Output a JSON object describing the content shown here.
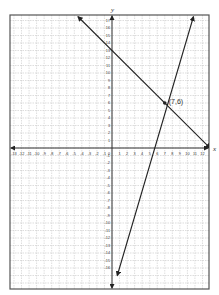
{
  "chart_data": {
    "type": "line",
    "title": "",
    "xlabel": "x",
    "ylabel": "y",
    "xlim": [
      -13,
      13
    ],
    "ylim": [
      -17,
      17
    ],
    "grid": true,
    "x_ticks": [
      -13,
      -12,
      -11,
      -10,
      -9,
      -8,
      -7,
      -6,
      -5,
      -4,
      -3,
      -2,
      -1,
      1,
      2,
      3,
      4,
      5,
      6,
      7,
      8,
      9,
      10,
      11,
      12
    ],
    "y_ticks": [
      -16,
      -15,
      -14,
      -13,
      -12,
      -11,
      -10,
      -9,
      -8,
      -7,
      -6,
      -5,
      -4,
      -3,
      -2,
      -1,
      1,
      2,
      3,
      4,
      5,
      6,
      7,
      8,
      9,
      10,
      11,
      12,
      13,
      14,
      15,
      16,
      17
    ],
    "origin_label": "0",
    "series": [
      {
        "name": "line1",
        "equation": "y = -x + 13",
        "points": [
          [
            -4.5,
            17.5
          ],
          [
            13,
            0
          ]
        ],
        "arrows": "both"
      },
      {
        "name": "line2",
        "equation": "y = 3x - 15",
        "points": [
          [
            0.7,
            -17
          ],
          [
            10.8,
            17.5
          ]
        ],
        "arrows": "both"
      }
    ],
    "annotations": [
      {
        "text": "(7,6)",
        "x": 7,
        "y": 6,
        "marker": "dot"
      }
    ]
  },
  "colors": {
    "frame": "#555555",
    "grid": "#c8c8c8",
    "axis": "#333333",
    "line": "#222222",
    "text": "#333333"
  }
}
